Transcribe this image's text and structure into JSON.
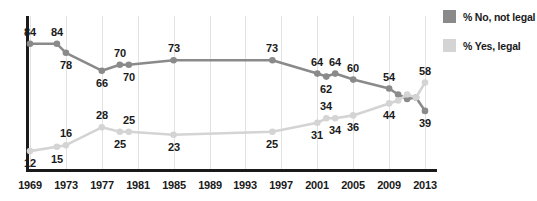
{
  "chart_data": {
    "type": "line",
    "title": "",
    "subtitle": "",
    "xlabel": "",
    "ylabel": "",
    "xlim": [
      1969,
      2014
    ],
    "ylim": [
      0,
      100
    ],
    "grid": true,
    "legend_position": "right",
    "x_tick_labels": [
      "1969",
      "1973",
      "1977",
      "1981",
      "1985",
      "1989",
      "1993",
      "1997",
      "2001",
      "2005",
      "2009",
      "2013"
    ],
    "x_tick_values": [
      1969,
      1973,
      1977,
      1981,
      1985,
      1989,
      1993,
      1997,
      2001,
      2005,
      2009,
      2013
    ],
    "series": [
      {
        "name": "% No, not legal",
        "color": "#8a8a8a",
        "x": [
          1969,
          1972,
          1973,
          1977,
          1979,
          1980,
          1985,
          1996,
          2001,
          2002,
          2003,
          2005,
          2009,
          2010,
          2011,
          2012,
          2013
        ],
        "values": [
          84,
          84,
          78,
          66,
          70,
          70,
          73,
          73,
          64,
          62,
          64,
          60,
          54,
          50,
          47,
          48,
          39
        ],
        "labels": [
          {
            "x": 1969,
            "y": 84,
            "text": "84",
            "pos": "above"
          },
          {
            "x": 1972,
            "y": 84,
            "text": "84",
            "pos": "above"
          },
          {
            "x": 1973,
            "y": 78,
            "text": "78",
            "pos": "below"
          },
          {
            "x": 1977,
            "y": 66,
            "text": "66",
            "pos": "below"
          },
          {
            "x": 1979,
            "y": 70,
            "text": "70",
            "pos": "above"
          },
          {
            "x": 1980,
            "y": 70,
            "text": "70",
            "pos": "below"
          },
          {
            "x": 1985,
            "y": 73,
            "text": "73",
            "pos": "above"
          },
          {
            "x": 1996,
            "y": 73,
            "text": "73",
            "pos": "above"
          },
          {
            "x": 2001,
            "y": 64,
            "text": "64",
            "pos": "above"
          },
          {
            "x": 2002,
            "y": 62,
            "text": "62",
            "pos": "below"
          },
          {
            "x": 2003,
            "y": 64,
            "text": "64",
            "pos": "above"
          },
          {
            "x": 2005,
            "y": 60,
            "text": "60",
            "pos": "above"
          },
          {
            "x": 2009,
            "y": 54,
            "text": "54",
            "pos": "above"
          },
          {
            "x": 2013,
            "y": 39,
            "text": "39",
            "pos": "below"
          }
        ]
      },
      {
        "name": "% Yes, legal",
        "color": "#d4d4d4",
        "x": [
          1969,
          1972,
          1973,
          1977,
          1979,
          1980,
          1985,
          1996,
          2001,
          2002,
          2003,
          2005,
          2009,
          2010,
          2011,
          2012,
          2013
        ],
        "values": [
          12,
          15,
          16,
          28,
          25,
          25,
          23,
          25,
          31,
          34,
          34,
          36,
          44,
          46,
          50,
          48,
          58
        ],
        "labels": [
          {
            "x": 1969,
            "y": 12,
            "text": "12",
            "pos": "below"
          },
          {
            "x": 1972,
            "y": 15,
            "text": "15",
            "pos": "below"
          },
          {
            "x": 1973,
            "y": 16,
            "text": "16",
            "pos": "above"
          },
          {
            "x": 1977,
            "y": 28,
            "text": "28",
            "pos": "above"
          },
          {
            "x": 1979,
            "y": 25,
            "text": "25",
            "pos": "below"
          },
          {
            "x": 1980,
            "y": 25,
            "text": "25",
            "pos": "above"
          },
          {
            "x": 1985,
            "y": 23,
            "text": "23",
            "pos": "below"
          },
          {
            "x": 1996,
            "y": 25,
            "text": "25",
            "pos": "below"
          },
          {
            "x": 2001,
            "y": 31,
            "text": "31",
            "pos": "below"
          },
          {
            "x": 2002,
            "y": 34,
            "text": "34",
            "pos": "above"
          },
          {
            "x": 2003,
            "y": 34,
            "text": "34",
            "pos": "below"
          },
          {
            "x": 2005,
            "y": 36,
            "text": "36",
            "pos": "below"
          },
          {
            "x": 2009,
            "y": 44,
            "text": "44",
            "pos": "below"
          },
          {
            "x": 2013,
            "y": 58,
            "text": "58",
            "pos": "above"
          }
        ]
      }
    ]
  },
  "legend": {
    "items": [
      {
        "label": "% No, not legal",
        "color": "#8a8a8a"
      },
      {
        "label": "% Yes, legal",
        "color": "#d4d4d4"
      }
    ]
  },
  "colors": {
    "no_legal": "#8a8a8a",
    "yes_legal": "#d4d4d4",
    "axis": "#1a1a1a",
    "grid": "#e2e2e2",
    "background": "#ffffff"
  }
}
